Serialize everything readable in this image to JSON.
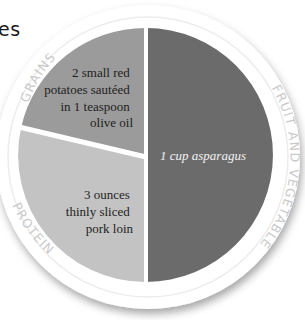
{
  "fragment_text": "es",
  "plate": {
    "sections": [
      {
        "id": "grains",
        "label": "GRAINS",
        "food": [
          "2 small red",
          "potatoes sautéed",
          "in 1 teaspoon",
          "olive oil"
        ],
        "color": "#9b9b9b",
        "text_color": "#1e1e1e"
      },
      {
        "id": "fruit_vegetable",
        "label": "FRUIT AND VEGETABLE",
        "food": [
          "1 cup asparagus"
        ],
        "color": "#6b6b6b",
        "text_color": "#f2f2f2"
      },
      {
        "id": "protein",
        "label": "PROTEIN",
        "food": [
          "3 ounces",
          "thinly sliced",
          "pork loin"
        ],
        "color": "#c3c3c3",
        "text_color": "#1e1e1e"
      }
    ],
    "rim_color": "#ffffff",
    "divider_color": "#ffffff",
    "label_color": "#c9c9c9"
  }
}
